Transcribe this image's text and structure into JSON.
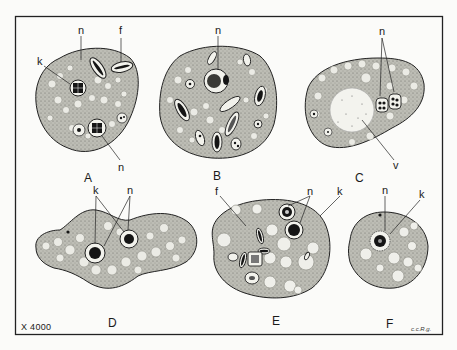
{
  "figure": {
    "scale_label": "X 4000",
    "signature": "c.c.R.g.",
    "panels": [
      {
        "id": "A",
        "label": "A",
        "structure_labels": [
          "k",
          "n",
          "f",
          "n"
        ]
      },
      {
        "id": "B",
        "label": "B",
        "structure_labels": [
          "n"
        ]
      },
      {
        "id": "C",
        "label": "C",
        "structure_labels": [
          "n",
          "v"
        ]
      },
      {
        "id": "D",
        "label": "D",
        "structure_labels": [
          "k",
          "n"
        ]
      },
      {
        "id": "E",
        "label": "E",
        "structure_labels": [
          "f",
          "n",
          "k"
        ]
      },
      {
        "id": "F",
        "label": "F",
        "structure_labels": [
          "n",
          "k"
        ]
      }
    ]
  },
  "colors": {
    "background": "#fbfbf9",
    "ink": "#1a1a1a",
    "cytoplasm": "#b9b9b2",
    "vacuole": "#ececE6",
    "frame": "#222222"
  }
}
